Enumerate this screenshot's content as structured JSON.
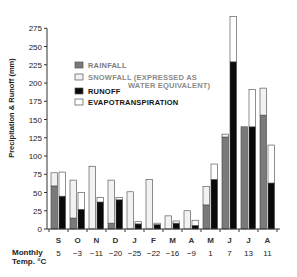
{
  "chart_data": {
    "type": "bar",
    "title": "",
    "xlabel": "",
    "ylabel": "Precipitation & Runoff (mm)",
    "ylim": [
      0,
      275
    ],
    "yticks": [
      0,
      25,
      50,
      75,
      100,
      125,
      150,
      175,
      200,
      225,
      250,
      275
    ],
    "categories": [
      "S",
      "O",
      "N",
      "D",
      "J",
      "F",
      "M",
      "A",
      "M",
      "J",
      "J",
      "A"
    ],
    "temperature_label_line1": "Monthly",
    "temperature_label_line2": "Temp. °C",
    "monthly_temp_c": [
      "5",
      "−3",
      "−11",
      "−20",
      "−25",
      "−22",
      "−16",
      "−9",
      "1",
      "7",
      "13",
      "11"
    ],
    "stacks": [
      {
        "bar": "precipitation",
        "series": [
          {
            "name": "RAINFALL",
            "color": "#7a7a7a",
            "values": [
              59,
              15,
              0,
              8,
              0,
              0,
              0,
              0,
              33,
              126,
              140,
              156
            ]
          },
          {
            "name": "SNOWFALL (EXPRESSED AS WATER EQUIVALENT)",
            "color": "#f2f2f2",
            "values": [
              18,
              52,
              86,
              59,
              51,
              68,
              18,
              25,
              25,
              4,
              0,
              37
            ]
          }
        ]
      },
      {
        "bar": "runoff_evapotranspiration",
        "series": [
          {
            "name": "RUNOFF",
            "color": "#0a0a0a",
            "values": [
              45,
              27,
              37,
              40,
              7,
              6,
              8,
              5,
              68,
              229,
              140,
              63
            ]
          },
          {
            "name": "EVAPOTRANSPIRATION",
            "color": "#ffffff",
            "values": [
              33,
              23,
              6,
              3,
              3,
              2,
              3,
              7,
              21,
              62,
              51,
              52
            ]
          }
        ]
      }
    ],
    "legend": [
      {
        "label": "RAINFALL",
        "color": "#7a7a7a",
        "text_color": "#7a7a7a"
      },
      {
        "label": "SNOWFALL (EXPRESSED AS",
        "label2": "WATER EQUIVALENT)",
        "color": "#f2f2f2",
        "text_color": "#8a8a8a"
      },
      {
        "label": "RUNOFF",
        "color": "#0a0a0a",
        "text_color": "#111111"
      },
      {
        "label": "EVAPOTRANSPIRATION",
        "color": "#ffffff",
        "text_color": "#111111"
      }
    ],
    "legend_position": "upper-left inside plot",
    "grid": false
  }
}
